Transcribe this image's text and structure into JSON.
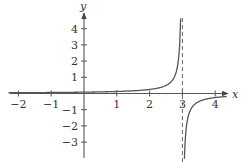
{
  "chart_data": {
    "type": "line",
    "title": "",
    "xlabel": "x",
    "ylabel": "y",
    "xlim": [
      -2.1,
      4.3
    ],
    "ylim": [
      -4.0,
      4.7
    ],
    "x_ticks": [
      -2,
      -1,
      1,
      2,
      3,
      4
    ],
    "y_ticks": [
      -3,
      -2,
      -1,
      1,
      2,
      3,
      4
    ],
    "x_tick_labels": [
      "−2",
      "−1",
      "1",
      "2",
      "3",
      "4"
    ],
    "y_tick_labels": [
      "−3",
      "−2",
      "−1",
      "1",
      "2",
      "3",
      "4"
    ],
    "grid": false,
    "legend": null,
    "asymptotes": [
      {
        "type": "vertical",
        "x": 3,
        "style": "dashed"
      }
    ],
    "series": [
      {
        "name": "left branch (x < 3)",
        "approx_formula": "0.25/(3-x)",
        "points": [
          [
            -2.1,
            0.05
          ],
          [
            -1,
            0.06
          ],
          [
            0,
            0.08
          ],
          [
            1,
            0.13
          ],
          [
            2,
            0.25
          ],
          [
            2.5,
            0.5
          ],
          [
            2.8,
            1.25
          ],
          [
            2.9,
            2.5
          ],
          [
            2.95,
            4.6
          ]
        ]
      },
      {
        "name": "right branch (x > 3)",
        "approx_formula": "0.25/(3-x)",
        "points": [
          [
            3.06,
            -4.0
          ],
          [
            3.1,
            -2.5
          ],
          [
            3.2,
            -1.25
          ],
          [
            3.5,
            -0.5
          ],
          [
            4,
            -0.25
          ],
          [
            4.3,
            -0.19
          ]
        ]
      }
    ]
  },
  "axes": {
    "x_name": "x",
    "y_name": "y"
  }
}
